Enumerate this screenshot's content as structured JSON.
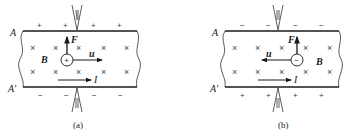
{
  "figure": {
    "panels": [
      {
        "id": "a",
        "caption": "(a)",
        "top_edge_label": "A",
        "bottom_edge_label": "A'",
        "top_charges": [
          "+",
          "+",
          "+",
          "+"
        ],
        "bottom_charges": [
          "−",
          "−",
          "−",
          "−"
        ],
        "carrier_sign": "+",
        "force_label": "F",
        "velocity_label": "u",
        "field_label": "B",
        "current_label": "I",
        "field_symbol": "×",
        "velocity_direction": "right",
        "force_direction": "up",
        "current_direction": "right"
      },
      {
        "id": "b",
        "caption": "(b)",
        "top_edge_label": "A",
        "bottom_edge_label": "A'",
        "top_charges": [
          "−",
          "−",
          "−",
          "−"
        ],
        "bottom_charges": [
          "+",
          "+",
          "+",
          "+"
        ],
        "carrier_sign": "−",
        "force_label": "F",
        "velocity_label": "u",
        "field_label": "B",
        "current_label": "I",
        "field_symbol": "×",
        "velocity_direction": "left",
        "force_direction": "up",
        "current_direction": "right"
      }
    ]
  }
}
